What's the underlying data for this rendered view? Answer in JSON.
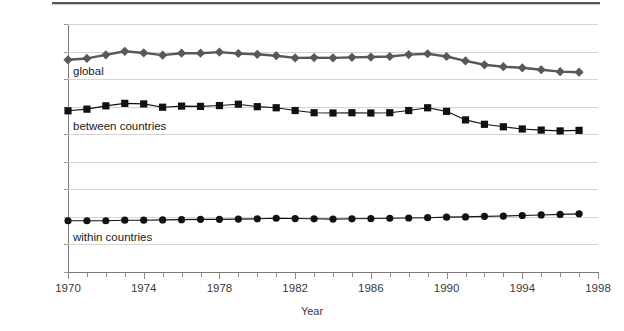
{
  "figure": {
    "background": "#ffffff",
    "has_top_rule": true
  },
  "axes": {
    "xlabel": "Year",
    "ylabel": "Theil index",
    "ytick_labels": [
      "0.9",
      "0.8",
      "0.7",
      "0.6",
      "0.5",
      "0.4",
      "0.3",
      "0.2",
      "0.1",
      "0"
    ],
    "xtick_labels": [
      "1970",
      "1974",
      "1978",
      "1982",
      "1986",
      "1990",
      "1994",
      "1998"
    ]
  },
  "labels": {
    "global": "global",
    "between": "between countries",
    "within": "within countries"
  },
  "colors": {
    "global": "#585858",
    "between": "#111111",
    "within": "#111111",
    "gridline": "#d4d4d4",
    "axis": "#7a7a7a",
    "text": "#3a3a3a"
  },
  "chart_data": {
    "type": "line",
    "title": "",
    "xlabel": "Year",
    "ylabel": "Theil index",
    "xlim": [
      1970,
      1998
    ],
    "ylim": [
      0,
      0.9
    ],
    "xticks": [
      1970,
      1974,
      1978,
      1982,
      1986,
      1990,
      1994,
      1998
    ],
    "yticks": [
      0,
      0.1,
      0.2,
      0.3,
      0.4,
      0.5,
      0.6,
      0.7,
      0.8,
      0.9
    ],
    "grid": "horizontal",
    "legend": "inline-labels",
    "x": [
      1970,
      1971,
      1972,
      1973,
      1974,
      1975,
      1976,
      1977,
      1978,
      1979,
      1980,
      1981,
      1982,
      1983,
      1984,
      1985,
      1986,
      1987,
      1988,
      1989,
      1990,
      1991,
      1992,
      1993,
      1994,
      1995,
      1996,
      1997
    ],
    "series": [
      {
        "name": "global",
        "marker": "diamond",
        "color": "#585858",
        "values": [
          0.77,
          0.775,
          0.788,
          0.801,
          0.795,
          0.787,
          0.794,
          0.794,
          0.798,
          0.793,
          0.79,
          0.785,
          0.777,
          0.778,
          0.777,
          0.779,
          0.78,
          0.782,
          0.789,
          0.792,
          0.782,
          0.766,
          0.752,
          0.745,
          0.741,
          0.734,
          0.727,
          0.725
        ]
      },
      {
        "name": "between countries",
        "marker": "square",
        "color": "#111111",
        "values": [
          0.585,
          0.591,
          0.603,
          0.612,
          0.61,
          0.598,
          0.602,
          0.601,
          0.604,
          0.609,
          0.6,
          0.596,
          0.586,
          0.578,
          0.577,
          0.578,
          0.577,
          0.578,
          0.586,
          0.596,
          0.583,
          0.552,
          0.536,
          0.527,
          0.519,
          0.515,
          0.512,
          0.514
        ]
      },
      {
        "name": "within countries",
        "marker": "circle",
        "color": "#111111",
        "values": [
          0.186,
          0.186,
          0.186,
          0.188,
          0.188,
          0.189,
          0.19,
          0.191,
          0.191,
          0.192,
          0.193,
          0.195,
          0.194,
          0.193,
          0.192,
          0.193,
          0.194,
          0.195,
          0.196,
          0.197,
          0.199,
          0.2,
          0.202,
          0.203,
          0.205,
          0.207,
          0.209,
          0.211
        ]
      }
    ]
  }
}
